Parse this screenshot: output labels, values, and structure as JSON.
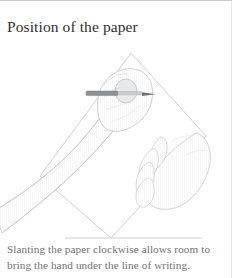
{
  "figure": {
    "title": "Position of the paper",
    "caption_lines": [
      "Slanting the paper clockwise allows room to",
      "bring the hand under the line of writing."
    ],
    "caption_full": "Slanting the paper clockwise allows room to bring the hand under the line of writing.",
    "illustration": {
      "alt": "Line drawing of a left arm and fist holding a pen at the top of a clockwise-slanted sheet of paper, with the other open hand resting on the desk to the right",
      "elements": [
        "slanted-paper",
        "writing-arm",
        "writing-fist",
        "pen",
        "resting-hand"
      ]
    },
    "colors": {
      "title_text": "#2e2e30",
      "caption_text": "#6f7173",
      "line_art": "#b9bcc0",
      "rule": "#c6c8ca",
      "background": "#ffffff",
      "pen_body": "#8d9094"
    }
  }
}
